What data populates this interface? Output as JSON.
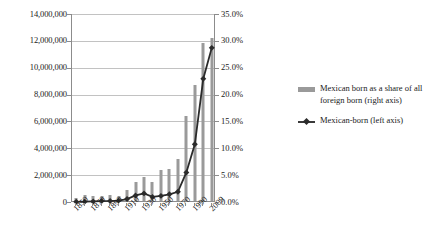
{
  "chart_data": {
    "type": "bar",
    "title": "",
    "subtitle": "",
    "xlabel": "",
    "ylabel": "",
    "grid": true,
    "legend_position": "right",
    "categories": [
      "1850",
      "1860",
      "1870",
      "1880",
      "1890",
      "1900",
      "1910",
      "1920",
      "1930",
      "1940",
      "1950",
      "1960",
      "1970",
      "1980",
      "1990",
      "2000",
      "2009"
    ],
    "x_tick_labels": [
      "1850",
      "",
      "1870",
      "",
      "1890",
      "",
      "1910",
      "",
      "1930",
      "",
      "1950",
      "",
      "1970",
      "",
      "1990",
      "",
      "2009"
    ],
    "left_axis": {
      "label": "Mexican-born (left axis)",
      "min": 0,
      "max": 14000000,
      "step": 2000000,
      "tick_labels": [
        "0",
        "2,000,000",
        "4,000,000",
        "6,000,000",
        "8,000,000",
        "10,000,000",
        "12,000,000",
        "14,000,000"
      ],
      "tick_values": [
        0,
        2000000,
        4000000,
        6000000,
        8000000,
        10000000,
        12000000,
        14000000
      ]
    },
    "right_axis": {
      "label": "Mexican born as a share of all foreign born (right axis)",
      "min": 0,
      "max": 0.35,
      "step": 0.05,
      "tick_labels": [
        "0.0%",
        "5.0%",
        "10.0%",
        "15.0%",
        "20.0%",
        "25.0%",
        "30.0%",
        "35.0%"
      ],
      "tick_values": [
        0,
        0.05,
        0.1,
        0.15,
        0.2,
        0.25,
        0.3,
        0.35
      ]
    },
    "series": [
      {
        "name": "Mexican born as a share of all foreign born (right axis)",
        "type": "bar",
        "axis": "right",
        "color": "#9a9a9a",
        "values": [
          0.006,
          0.012,
          0.01,
          0.01,
          0.012,
          0.01,
          0.02,
          0.035,
          0.045,
          0.035,
          0.058,
          0.06,
          0.078,
          0.158,
          0.216,
          0.295,
          0.303
        ]
      },
      {
        "name": "Mexican-born (left axis)",
        "type": "line",
        "axis": "left",
        "color": "#2b2b2b",
        "marker": "diamond",
        "values": [
          13000,
          27000,
          42000,
          68000,
          78000,
          103000,
          222000,
          486000,
          641000,
          377000,
          454000,
          576000,
          760000,
          2199000,
          4298000,
          9177000,
          11478000
        ]
      }
    ]
  },
  "legend": {
    "entries": [
      {
        "label": "Mexican born as a share of all foreign born (right axis)",
        "marker": "bar-swatch"
      },
      {
        "label": "Mexican-born (left axis)",
        "marker": "line-diamond-swatch"
      }
    ]
  },
  "colors": {
    "bar": "#9a9a9a",
    "line": "#2b2b2b",
    "grid": "#c2c2c2",
    "axis": "#8c8c8c",
    "text": "#1a1a1a",
    "background": "#ffffff"
  }
}
